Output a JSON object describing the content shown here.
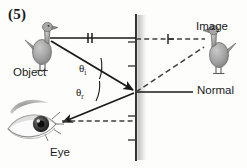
{
  "figure": {
    "number": "(5)",
    "type": "plane-mirror reflection ray diagram"
  },
  "labels": {
    "object": "Object",
    "image": "Image",
    "normal": "Normal",
    "eye": "Eye",
    "angle_incidence": "θ",
    "angle_incidence_sub": "i",
    "angle_reflection": "θ",
    "angle_reflection_sub": "r"
  },
  "colors": {
    "line": "#1a1a1a",
    "dashed": "#4a4a4a",
    "mirror": "#2b2b2b",
    "mirror_shadow": "#bdbdbd",
    "duck_body": "#9a9a9a",
    "duck_outline": "#5a5a5a",
    "text": "#1b1b1b",
    "background": "#fdfdfc"
  },
  "markings": {
    "object_distance_tick": "‖",
    "image_distance_tick": "⊢"
  },
  "geometry": {
    "mirror_x": 136,
    "mirror_top_y": 14,
    "mirror_bottom_y": 160,
    "reflection_point": [
      136,
      92
    ],
    "object_point": [
      46,
      38
    ],
    "image_point": [
      213,
      40
    ],
    "eye_point": [
      57,
      120
    ]
  }
}
